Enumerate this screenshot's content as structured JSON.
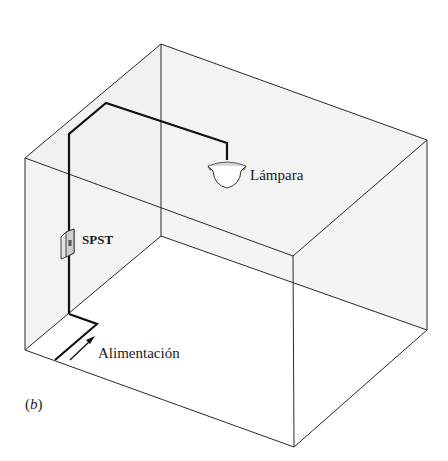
{
  "figure": {
    "caption_open": "(",
    "caption_letter": "b",
    "caption_close": ")",
    "labels": {
      "lamp": "Lámpara",
      "switch": "SPST",
      "power": "Alimentación"
    },
    "components": [
      {
        "name": "lamp",
        "type": "ceiling-lamp-icon"
      },
      {
        "name": "switch",
        "type": "wall-switch-icon",
        "label": "SPST"
      },
      {
        "name": "power-feed",
        "type": "arrow-icon",
        "direction": "up-right"
      }
    ],
    "colors": {
      "line": "#2a2a2a",
      "wire": "#111111",
      "wall_fill": "#f1f1f1",
      "floor_fill": "#ffffff",
      "text": "#1a1a1a"
    }
  }
}
